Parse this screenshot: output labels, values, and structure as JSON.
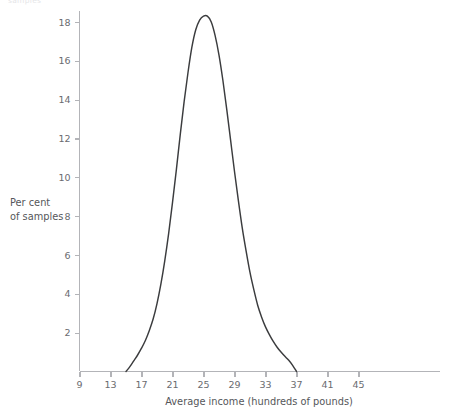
{
  "caption": {
    "text": "samples"
  },
  "chart_data": {
    "type": "line",
    "title": "",
    "xlabel": "Average income (hundreds of pounds)",
    "ylabel": "Per cent of samples",
    "ylabel_line1": "Per cent",
    "ylabel_line2": "of samples",
    "xlim": [
      9,
      45
    ],
    "ylim": [
      0,
      19.4
    ],
    "xticks": [
      9,
      13,
      17,
      21,
      25,
      29,
      33,
      37,
      41,
      45
    ],
    "xticklabels": [
      "9",
      "13",
      "17",
      "21",
      "25",
      "29",
      "33",
      "37",
      "41",
      "45"
    ],
    "yticks": [
      2,
      4,
      6,
      8,
      10,
      12,
      14,
      16,
      18
    ],
    "yticklabels": [
      "2",
      "4",
      "6",
      "8",
      "10",
      "12",
      "14",
      "16",
      "18"
    ],
    "grid": false,
    "legend": false,
    "curve_color": "#3b3c3e",
    "axis_color": "#b3b4b8",
    "text_color": "#55565a",
    "background": "#ffffff",
    "peak": {
      "x": 25.5,
      "y": 18.3
    },
    "series": [
      {
        "name": "Distribution of sample means",
        "x": [
          15.0,
          15.5,
          16.0,
          16.5,
          17.0,
          17.5,
          18.0,
          18.5,
          19.0,
          19.5,
          20.0,
          20.5,
          21.0,
          21.5,
          22.0,
          22.5,
          23.0,
          23.5,
          24.0,
          24.5,
          25.0,
          25.5,
          26.0,
          26.5,
          27.0,
          27.5,
          28.0,
          28.5,
          29.0,
          29.5,
          30.0,
          30.5,
          31.0,
          31.5,
          32.0,
          32.5,
          33.0,
          33.5,
          34.0,
          34.5,
          35.0,
          35.5,
          36.0,
          36.5,
          37.0
        ],
        "values": [
          0.0,
          0.25,
          0.55,
          0.85,
          1.2,
          1.6,
          2.1,
          2.7,
          3.5,
          4.5,
          5.7,
          7.1,
          8.7,
          10.4,
          12.2,
          13.9,
          15.4,
          16.7,
          17.6,
          18.1,
          18.3,
          18.3,
          18.0,
          17.3,
          16.3,
          15.0,
          13.5,
          11.9,
          10.3,
          8.8,
          7.4,
          6.2,
          5.1,
          4.2,
          3.4,
          2.8,
          2.3,
          1.9,
          1.55,
          1.25,
          1.0,
          0.78,
          0.58,
          0.32,
          0.0
        ]
      }
    ]
  }
}
